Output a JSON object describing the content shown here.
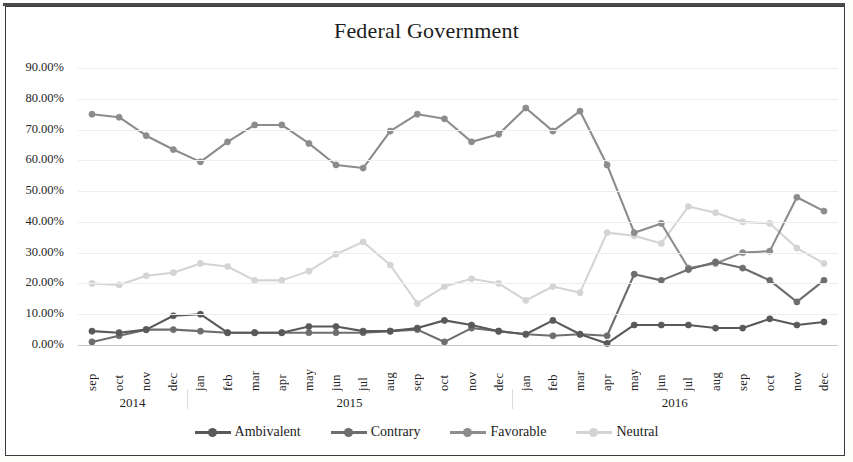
{
  "chart_data": {
    "type": "line",
    "title": "Federal Government",
    "xlabel": "",
    "ylabel": "",
    "ylim": [
      0,
      90
    ],
    "ytick_values": [
      90,
      80,
      70,
      60,
      50,
      40,
      30,
      20,
      10,
      0
    ],
    "ytick_labels": [
      "90.00%",
      "80.00%",
      "70.00%",
      "60.00%",
      "50.00%",
      "40.00%",
      "30.00%",
      "20.00%",
      "10.00%",
      "0.00%"
    ],
    "grid": true,
    "legend_position": "bottom",
    "value_unit": "percent",
    "x": [
      "sep",
      "oct",
      "nov",
      "dec",
      "jan",
      "feb",
      "mar",
      "apr",
      "may",
      "jun",
      "jul",
      "aug",
      "sep",
      "oct",
      "nov",
      "dec",
      "jan",
      "feb",
      "mar",
      "apr",
      "may",
      "jun",
      "jul",
      "aug",
      "sep",
      "oct",
      "nov",
      "dec"
    ],
    "x_groups": [
      {
        "label": "2014",
        "start": 0,
        "count": 4
      },
      {
        "label": "2015",
        "start": 4,
        "count": 12
      },
      {
        "label": "2016",
        "start": 16,
        "count": 12
      }
    ],
    "series": [
      {
        "name": "Ambivalent",
        "color": "#595959",
        "values": [
          4.5,
          4.0,
          5.0,
          9.5,
          10.0,
          4.0,
          4.0,
          4.0,
          6.0,
          6.0,
          4.5,
          4.5,
          5.5,
          8.0,
          6.5,
          4.5,
          3.5,
          8.0,
          3.5,
          0.5,
          6.5,
          6.5,
          6.5,
          5.5,
          5.5,
          8.5,
          6.5,
          7.5
        ]
      },
      {
        "name": "Contrary",
        "color": "#6e6e6e",
        "values": [
          1.0,
          3.0,
          5.0,
          5.0,
          4.5,
          4.0,
          4.0,
          4.0,
          4.0,
          4.0,
          4.0,
          4.5,
          5.0,
          1.0,
          5.5,
          4.5,
          3.5,
          3.0,
          3.5,
          3.0,
          23.0,
          21.0,
          24.5,
          27.0,
          25.0,
          21.0,
          14.0,
          21.0
        ]
      },
      {
        "name": "Favorable",
        "color": "#8c8c8c",
        "values": [
          75.0,
          74.0,
          68.0,
          63.5,
          59.5,
          66.0,
          71.5,
          71.5,
          65.5,
          58.5,
          57.5,
          69.5,
          75.0,
          73.5,
          66.0,
          68.5,
          77.0,
          69.5,
          76.0,
          58.5,
          36.5,
          39.5,
          25.0,
          26.5,
          30.0,
          30.5,
          48.0,
          43.5
        ]
      },
      {
        "name": "Neutral",
        "color": "#d4d4d4",
        "values": [
          20.0,
          19.5,
          22.5,
          23.5,
          26.5,
          25.5,
          21.0,
          21.0,
          24.0,
          29.5,
          33.5,
          26.0,
          13.5,
          19.0,
          21.5,
          20.0,
          14.5,
          19.0,
          17.0,
          36.5,
          35.5,
          33.0,
          45.0,
          43.0,
          40.0,
          39.5,
          31.5,
          26.5
        ]
      }
    ]
  },
  "legend": [
    {
      "label": "Ambivalent",
      "color": "#595959"
    },
    {
      "label": "Contrary",
      "color": "#6e6e6e"
    },
    {
      "label": "Favorable",
      "color": "#8c8c8c"
    },
    {
      "label": "Neutral",
      "color": "#d4d4d4"
    }
  ]
}
